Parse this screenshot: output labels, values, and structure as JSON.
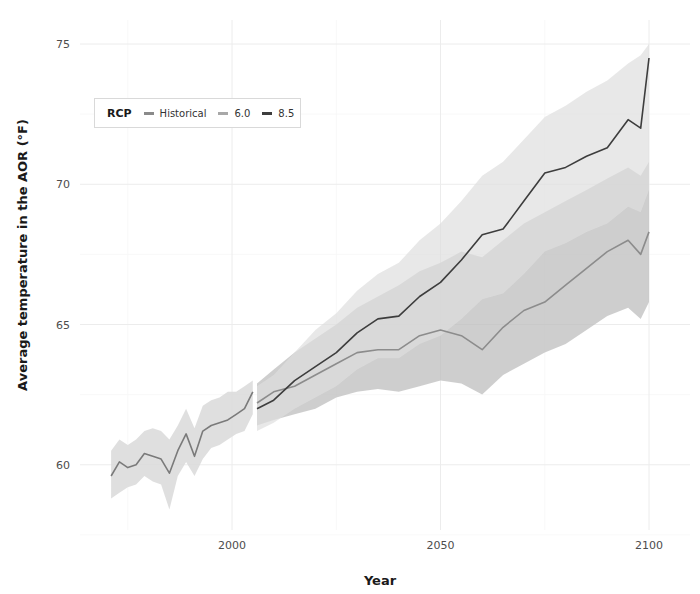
{
  "chart_data": {
    "type": "line",
    "title": "",
    "xlabel": "Year",
    "ylabel": "Average temperature in the AOR (°F)",
    "xlim": [
      1966,
      2106
    ],
    "ylim": [
      57.5,
      75.5
    ],
    "x_ticks": [
      2000,
      2050,
      2100
    ],
    "y_ticks": [
      60,
      65,
      70,
      75
    ],
    "grid": true,
    "legend": {
      "title": "RCP",
      "position": "top-left inside",
      "entries": [
        "Historical",
        "6.0",
        "8.5"
      ]
    },
    "series": [
      {
        "name": "Historical",
        "color": "#7a7a7a",
        "x": [
          1971,
          1973,
          1975,
          1977,
          1979,
          1981,
          1983,
          1985,
          1987,
          1989,
          1991,
          1993,
          1995,
          1997,
          1999,
          2001,
          2003,
          2005
        ],
        "values": [
          59.6,
          60.1,
          59.9,
          60.0,
          60.4,
          60.3,
          60.2,
          59.7,
          60.5,
          61.1,
          60.3,
          61.2,
          61.4,
          61.5,
          61.6,
          61.8,
          62.0,
          62.6
        ],
        "band_low": [
          58.8,
          59.0,
          59.2,
          59.3,
          59.6,
          59.4,
          59.3,
          58.4,
          59.6,
          60.1,
          59.6,
          60.2,
          60.6,
          60.7,
          60.9,
          61.1,
          61.2,
          61.8
        ],
        "band_high": [
          60.5,
          60.9,
          60.7,
          60.9,
          61.2,
          61.3,
          61.2,
          60.9,
          61.4,
          62.0,
          61.3,
          62.1,
          62.3,
          62.4,
          62.6,
          62.6,
          62.8,
          63.0
        ]
      },
      {
        "name": "6.0",
        "color": "#8c8c8c",
        "x": [
          2006,
          2010,
          2015,
          2020,
          2025,
          2030,
          2035,
          2040,
          2045,
          2050,
          2055,
          2060,
          2065,
          2070,
          2075,
          2080,
          2085,
          2090,
          2095,
          2098,
          2100
        ],
        "values": [
          62.2,
          62.6,
          62.8,
          63.2,
          63.6,
          64.0,
          64.1,
          64.1,
          64.6,
          64.8,
          64.6,
          64.1,
          64.9,
          65.5,
          65.8,
          66.4,
          67.0,
          67.6,
          68.0,
          67.5,
          68.3
        ],
        "band_low": [
          61.4,
          61.6,
          61.8,
          62.0,
          62.4,
          62.6,
          62.7,
          62.6,
          62.8,
          63.0,
          62.9,
          62.5,
          63.2,
          63.6,
          64.0,
          64.3,
          64.8,
          65.3,
          65.6,
          65.2,
          65.8
        ],
        "band_high": [
          62.9,
          63.4,
          64.0,
          64.5,
          65.0,
          65.6,
          66.0,
          66.4,
          66.9,
          67.2,
          67.6,
          67.4,
          68.0,
          68.6,
          69.0,
          69.4,
          69.8,
          70.2,
          70.6,
          70.3,
          70.8
        ]
      },
      {
        "name": "8.5",
        "color": "#3d3d3d",
        "x": [
          2006,
          2010,
          2015,
          2020,
          2025,
          2030,
          2035,
          2040,
          2045,
          2050,
          2055,
          2060,
          2065,
          2070,
          2075,
          2080,
          2085,
          2090,
          2095,
          2098,
          2100
        ],
        "values": [
          62.0,
          62.3,
          63.0,
          63.5,
          64.0,
          64.7,
          65.2,
          65.3,
          66.0,
          66.5,
          67.3,
          68.2,
          68.4,
          69.4,
          70.4,
          70.6,
          71.0,
          71.3,
          72.3,
          72.0,
          74.5
        ],
        "band_low": [
          61.2,
          61.5,
          62.0,
          62.4,
          62.8,
          63.4,
          63.8,
          63.8,
          64.3,
          64.6,
          65.2,
          65.9,
          66.1,
          66.8,
          67.6,
          67.9,
          68.3,
          68.6,
          69.2,
          69.0,
          69.8
        ],
        "band_high": [
          62.8,
          63.2,
          64.0,
          64.8,
          65.4,
          66.2,
          66.8,
          67.2,
          68.0,
          68.6,
          69.4,
          70.3,
          70.8,
          71.6,
          72.4,
          72.8,
          73.3,
          73.7,
          74.3,
          74.6,
          75.0
        ]
      }
    ]
  },
  "legend": {
    "title": "RCP",
    "items": [
      {
        "label": "Historical",
        "color": "#8a8a8a"
      },
      {
        "label": "6.0",
        "color": "#9a9a9a"
      },
      {
        "label": "8.5",
        "color": "#3d3d3d"
      }
    ]
  },
  "axes": {
    "x_title": "Year",
    "y_title": "Average temperature in the AOR (°F)",
    "x_tick_labels": [
      "2000",
      "2050",
      "2100"
    ],
    "y_tick_labels": [
      "60",
      "65",
      "70",
      "75"
    ]
  }
}
